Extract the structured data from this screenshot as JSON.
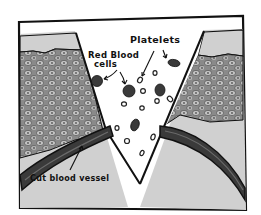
{
  "diagram": {
    "labels": {
      "platelets": "Platelets",
      "red_blood_cells_line1": "Red Blood",
      "red_blood_cells_line2": "cells",
      "cut_blood_vessel": "Cut blood vessel"
    },
    "colors": {
      "outline": "#111111",
      "skin_top": "#d6d6d6",
      "tissue_fill": "#8a8a8a",
      "cell_fill": "#bdbdbd",
      "lower_tissue": "#d2d2d2",
      "vessel": "#3a3a3a",
      "wound_gap": "#ffffff"
    }
  }
}
